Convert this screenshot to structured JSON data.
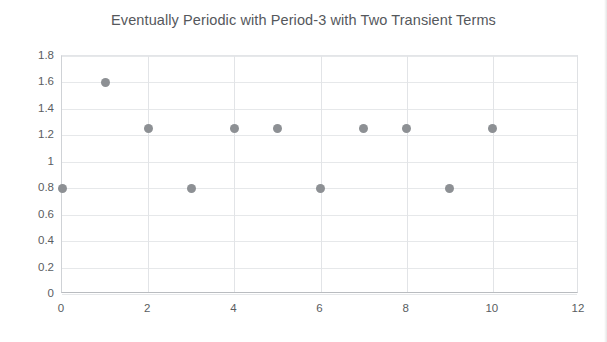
{
  "chart_data": {
    "type": "scatter",
    "title": "Eventually Periodic with Period-3 with Two Transient Terms",
    "xlabel": "",
    "ylabel": "",
    "x": [
      0,
      1,
      2,
      3,
      4,
      5,
      6,
      7,
      8,
      9,
      10
    ],
    "values": [
      0.8,
      1.6,
      1.25,
      0.8,
      1.25,
      1.25,
      0.8,
      1.25,
      1.25,
      0.8,
      1.25
    ],
    "series": [
      {
        "name": "sequence",
        "points": [
          {
            "x": 0,
            "y": 0.8
          },
          {
            "x": 1,
            "y": 1.6
          },
          {
            "x": 2,
            "y": 1.25
          },
          {
            "x": 3,
            "y": 0.8
          },
          {
            "x": 4,
            "y": 1.25
          },
          {
            "x": 5,
            "y": 1.25
          },
          {
            "x": 6,
            "y": 0.8
          },
          {
            "x": 7,
            "y": 1.25
          },
          {
            "x": 8,
            "y": 1.25
          },
          {
            "x": 9,
            "y": 0.8
          },
          {
            "x": 10,
            "y": 1.25
          }
        ],
        "marker_color": "#8d9094",
        "marker_shape": "circle"
      }
    ],
    "xlim": [
      0,
      12
    ],
    "ylim": [
      0,
      1.8
    ],
    "xticks": [
      0,
      2,
      4,
      6,
      8,
      10,
      12
    ],
    "xtick_labels": [
      "0",
      "2",
      "4",
      "6",
      "8",
      "10",
      "12"
    ],
    "yticks": [
      0,
      0.2,
      0.4,
      0.6,
      0.8,
      1.0,
      1.2,
      1.4,
      1.6,
      1.8
    ],
    "ytick_labels": [
      "0",
      "0.2",
      "0.4",
      "0.6",
      "0.8",
      "1",
      "1.2",
      "1.4",
      "1.6",
      "1.8"
    ],
    "grid": true,
    "grid_x": true,
    "grid_y": true,
    "legend": false,
    "legend_position": "none",
    "colors": {
      "marker": "#8d9094",
      "grid": "#e6e8ea",
      "axis": "#b9bcc0",
      "text": "#55585c",
      "background": "#ffffff"
    }
  }
}
